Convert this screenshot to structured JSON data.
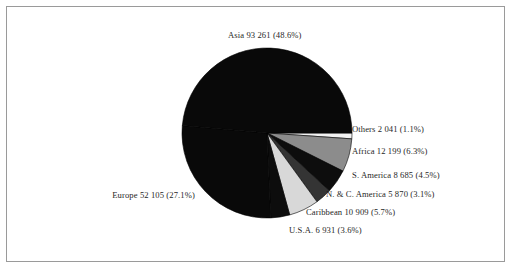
{
  "figure": {
    "background_color": "#ffffff",
    "frame_color": "#9a9a9a",
    "text_color": "#1f1f1f"
  },
  "chart_data": {
    "type": "pie",
    "title": "",
    "subtitle": "",
    "xlabel": "",
    "ylabel": "",
    "legend_position": "none",
    "grid": false,
    "total": 191901,
    "categories": [
      "Asia",
      "Others",
      "Africa",
      "S. America",
      "N. & C. America",
      "Caribbean",
      "U.S.A.",
      "Europe"
    ],
    "values": [
      93261,
      2041,
      12199,
      8685,
      5870,
      10909,
      6931,
      52105
    ],
    "percents": [
      48.6,
      1.1,
      6.3,
      4.5,
      3.1,
      5.7,
      3.6,
      27.1
    ],
    "slices": [
      {
        "name": "asia",
        "label": "Asia 93 261 (48.6%)",
        "category": "Asia",
        "value": 93261,
        "value_text": "93 261",
        "percent": 48.6,
        "percent_text": "(48.6%)",
        "color": "#090909"
      },
      {
        "name": "others",
        "label": "Others 2 041 (1.1%)",
        "category": "Others",
        "value": 2041,
        "value_text": "2 041",
        "percent": 1.1,
        "percent_text": "(1.1%)",
        "color": "#f2f2f2"
      },
      {
        "name": "africa",
        "label": "Africa 12 199 (6.3%)",
        "category": "Africa",
        "value": 12199,
        "value_text": "12 199",
        "percent": 6.3,
        "percent_text": "(6.3%)",
        "color": "#8c8c8c"
      },
      {
        "name": "s-america",
        "label": "S. America 8 685 (4.5%)",
        "category": "S. America",
        "value": 8685,
        "value_text": "8 685",
        "percent": 4.5,
        "percent_text": "(4.5%)",
        "color": "#0d0d0d"
      },
      {
        "name": "n-c-america",
        "label": "N. & C. America 5 870 (3.1%)",
        "category": "N. & C. America",
        "value": 5870,
        "value_text": "5 870",
        "percent": 3.1,
        "percent_text": "(3.1%)",
        "color": "#343434"
      },
      {
        "name": "caribbean",
        "label": "Caribbean 10 909 (5.7%)",
        "category": "Caribbean",
        "value": 10909,
        "value_text": "10 909",
        "percent": 5.7,
        "percent_text": "(5.7%)",
        "color": "#d8d8d8"
      },
      {
        "name": "usa",
        "label": "U.S.A. 6 931 (3.6%)",
        "category": "U.S.A.",
        "value": 6931,
        "value_text": "6 931",
        "percent": 3.6,
        "percent_text": "(3.6%)",
        "color": "#0d0d0d"
      },
      {
        "name": "europe",
        "label": "Europe 52 105 (27.1%)",
        "category": "Europe",
        "value": 52105,
        "value_text": "52 105",
        "percent": 27.1,
        "percent_text": "(27.1%)",
        "color": "#090909"
      }
    ],
    "geometry": {
      "center_x": 267,
      "center_y": 133,
      "radius": 85,
      "start_angle_deg": 0,
      "direction": "clockwise"
    }
  }
}
